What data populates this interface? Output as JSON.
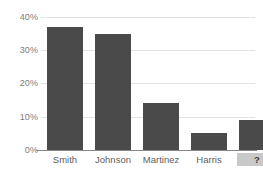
{
  "chart_data": {
    "type": "bar",
    "title": "",
    "xlabel": "",
    "ylabel": "",
    "categories": [
      "Smith",
      "Johnson",
      "Martinez",
      "Harris",
      "?"
    ],
    "values": [
      37,
      35,
      14,
      5,
      9
    ],
    "ylim": [
      0,
      40
    ],
    "ytick_labels": [
      "0%",
      "10%",
      "20%",
      "30%",
      "40%"
    ],
    "ytick_values": [
      0,
      10,
      20,
      30,
      40
    ],
    "grid": true,
    "legend": "none",
    "bar_color": "#4a4a4a",
    "gridline_color": "#e3e3e3",
    "axis_color": "#8a8a8a",
    "background_color": "#ffffff",
    "tick_label_color": "#7d7d7d",
    "category_label_color": "#606060",
    "highlighted_category": "?",
    "highlight_color": "#c9c9c9"
  }
}
